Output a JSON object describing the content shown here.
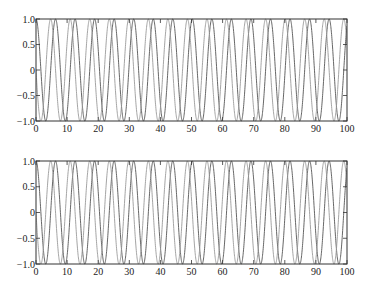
{
  "figure": {
    "width": 372,
    "height": 294,
    "background": "#ffffff"
  },
  "chart_data": [
    {
      "type": "line",
      "title": "",
      "xlabel": "",
      "ylabel": "",
      "xlim": [
        0,
        100
      ],
      "ylim": [
        -1.0,
        1.0
      ],
      "grid": false,
      "legend": null,
      "xticks": [
        0,
        10,
        20,
        30,
        40,
        50,
        60,
        70,
        80,
        90,
        100
      ],
      "xtick_labels": [
        "0",
        "10",
        "20",
        "30",
        "40",
        "50",
        "60",
        "70",
        "80",
        "90",
        "100"
      ],
      "yticks": [
        -1.0,
        -0.5,
        0,
        0.5,
        1.0
      ],
      "ytick_labels": [
        "-1.0",
        "-0.5",
        "0",
        "0.5",
        "1.0"
      ],
      "box": {
        "left": 36,
        "top": 19,
        "right": 347,
        "bottom": 121
      },
      "series": [
        {
          "name": "cos(x)",
          "function": "cos",
          "color": "#555555",
          "x_range": [
            0,
            100
          ]
        },
        {
          "name": "-sin(x)",
          "function": "-sin",
          "color": "#9a9a9a",
          "x_range": [
            0,
            100
          ]
        }
      ]
    },
    {
      "type": "line",
      "title": "",
      "xlabel": "",
      "ylabel": "",
      "xlim": [
        0,
        100
      ],
      "ylim": [
        -1.0,
        1.0
      ],
      "grid": false,
      "legend": null,
      "xticks": [
        0,
        10,
        20,
        30,
        40,
        50,
        60,
        70,
        80,
        90,
        100
      ],
      "xtick_labels": [
        "0",
        "10",
        "20",
        "30",
        "40",
        "50",
        "60",
        "70",
        "80",
        "90",
        "100"
      ],
      "yticks": [
        -1.0,
        -0.5,
        0,
        0.5,
        1.0
      ],
      "ytick_labels": [
        "-1.0",
        "-0.5",
        "0",
        "0.5",
        "1.0"
      ],
      "box": {
        "left": 36,
        "top": 161,
        "right": 347,
        "bottom": 264
      },
      "series": [
        {
          "name": "cos(x)",
          "function": "cos",
          "color": "#555555",
          "x_range": [
            0,
            100
          ]
        },
        {
          "name": "-sin(x)",
          "function": "-sin",
          "color": "#9a9a9a",
          "x_range": [
            0,
            100
          ]
        }
      ]
    }
  ]
}
